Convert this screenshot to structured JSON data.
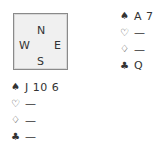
{
  "compass": {
    "north": "N",
    "west": "W",
    "east": "E",
    "south": "S"
  },
  "hands": {
    "north": [
      {
        "suit": "spades",
        "symbol": "♠",
        "cards": "A 7"
      },
      {
        "suit": "hearts",
        "symbol": "♡",
        "cards": "—"
      },
      {
        "suit": "diamonds",
        "symbol": "♢",
        "cards": "—"
      },
      {
        "suit": "clubs",
        "symbol": "♣",
        "cards": "Q"
      }
    ],
    "west": [
      {
        "suit": "spades",
        "symbol": "♠",
        "cards": "J 10 6"
      },
      {
        "suit": "hearts",
        "symbol": "♡",
        "cards": "—"
      },
      {
        "suit": "diamonds",
        "symbol": "♢",
        "cards": "—"
      },
      {
        "suit": "clubs",
        "symbol": "♣",
        "cards": "—"
      }
    ]
  }
}
